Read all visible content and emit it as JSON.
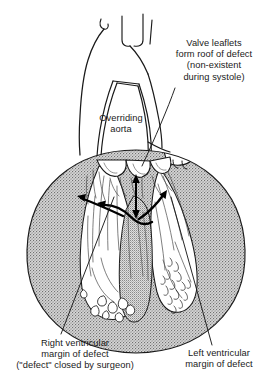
{
  "figure": {
    "background_color": "#ffffff",
    "ink_color": "#1a1a1a",
    "myocardium_fill": "#b4b4b4",
    "cavity_fill": "#ffffff"
  },
  "labels": {
    "valve_leaflets": {
      "text": "Valve leaflets\nform roof of defect\n(non-existent\nduring systole)",
      "lines": [
        "Valve leaflets",
        "form roof of defect",
        "(non-existent",
        "during systole)"
      ]
    },
    "overriding_aorta": {
      "text": "Overriding\naorta",
      "lines": [
        "Overriding",
        "aorta"
      ]
    },
    "right_ventricular_margin": {
      "text": "Right ventricular\nmargin of defect\n(\"defect\" closed by surgeon)",
      "lines": [
        "Right ventricular",
        "margin of defect",
        "(\"defect\" closed by surgeon)"
      ]
    },
    "left_ventricular_margin": {
      "text": "Left ventricular\nmargin of defect",
      "lines": [
        "Left ventricular",
        "margin of defect"
      ]
    }
  },
  "anatomy": {
    "great_vessels": "aortic arch branches (cut)",
    "ascending_aorta": "overriding aorta lumen",
    "aortic_valve": "aortic valve leaflets",
    "septum": "interventricular septum",
    "right_ventricle": "right ventricular cavity",
    "left_ventricle": "left ventricular cavity",
    "left_atrial_appendage": "left atrial appendage",
    "trabeculae": "apical trabeculae carneae"
  },
  "annotations": {
    "defect_arrows": "double-headed arrows spanning the ventricular septal defect",
    "leader_lines": 3
  }
}
